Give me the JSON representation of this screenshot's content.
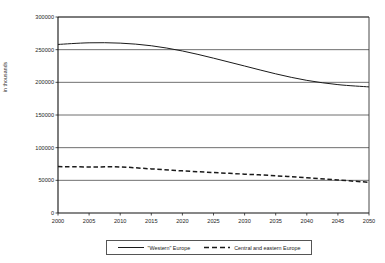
{
  "chart_data": {
    "type": "line",
    "title": "",
    "subtitle": "",
    "xlabel": "",
    "ylabel": "in thousands",
    "xlim": [
      2000,
      2050
    ],
    "ylim": [
      0,
      300000
    ],
    "grid": "horizontal",
    "legend_position": "bottom",
    "x_ticks": [
      "2000",
      "2005",
      "2010",
      "2015",
      "2020",
      "2025",
      "2030",
      "2035",
      "2040",
      "2045",
      "2050"
    ],
    "y_ticks": [
      "0",
      "50000",
      "100000",
      "150000",
      "200000",
      "250000",
      "300000"
    ],
    "x": [
      2000,
      2005,
      2010,
      2015,
      2020,
      2025,
      2030,
      2035,
      2040,
      2045,
      2050
    ],
    "series": [
      {
        "name": "\"Western\" Europe",
        "style": "solid",
        "color": "#1a1a1a",
        "values": [
          258000,
          260500,
          260000,
          256000,
          248000,
          237000,
          225000,
          213000,
          203000,
          196500,
          193000
        ]
      },
      {
        "name": "Central and eastern Europe",
        "style": "dashed",
        "color": "#1a1a1a",
        "values": [
          71000,
          70500,
          70500,
          67500,
          64500,
          62000,
          59500,
          57000,
          54000,
          50500,
          47000
        ]
      }
    ]
  }
}
